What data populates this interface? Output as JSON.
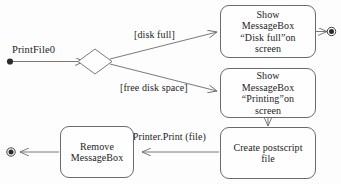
{
  "diagram": {
    "type": "uml-activity-diagram",
    "background_color": "#fdfdfd",
    "line_color": "#6b6b6b",
    "text_color": "#1c1c1c",
    "start_label": "PrintFile0",
    "nodes": [
      {
        "id": "start",
        "kind": "initial-node",
        "label": ""
      },
      {
        "id": "decision",
        "kind": "decision-diamond",
        "label": ""
      },
      {
        "id": "show_disk_full",
        "kind": "action",
        "label": "Show MessageBox “Disk full”on screen"
      },
      {
        "id": "show_printing",
        "kind": "action",
        "label": "Show MessageBox “Printing”on screen"
      },
      {
        "id": "create_postscript",
        "kind": "action",
        "label": "Create postscript file"
      },
      {
        "id": "remove_messagebox",
        "kind": "action",
        "label": "Remove MessageBox"
      },
      {
        "id": "end_right",
        "kind": "final-node",
        "label": ""
      },
      {
        "id": "end_left",
        "kind": "final-node",
        "label": ""
      }
    ],
    "edges": [
      {
        "from": "start",
        "to": "decision",
        "label": ""
      },
      {
        "from": "decision",
        "to": "show_disk_full",
        "label": "[disk full]"
      },
      {
        "from": "decision",
        "to": "show_printing",
        "label": "[free disk space]"
      },
      {
        "from": "show_disk_full",
        "to": "end_right",
        "label": ""
      },
      {
        "from": "show_printing",
        "to": "create_postscript",
        "label": ""
      },
      {
        "from": "create_postscript",
        "to": "remove_messagebox",
        "label": "^Printer.Print (file)"
      },
      {
        "from": "remove_messagebox",
        "to": "end_left",
        "label": ""
      }
    ],
    "box_text": {
      "show_disk_full_l1": "Show",
      "show_disk_full_l2": "MessageBox",
      "show_disk_full_l3": "“Disk full”on",
      "show_disk_full_l4": "screen",
      "show_printing_l1": "Show",
      "show_printing_l2": "MessageBox",
      "show_printing_l3": "“Printing”on",
      "show_printing_l4": "screen",
      "create_postscript_l1": "Create postscript",
      "create_postscript_l2": "file",
      "remove_messagebox_l1": "Remove",
      "remove_messagebox_l2": "MessageBox"
    },
    "labels": {
      "guard_disk_full": "[disk full]",
      "guard_free_space": "[free disk space]",
      "action_printer_print": "^Printer.Print (file)"
    }
  }
}
